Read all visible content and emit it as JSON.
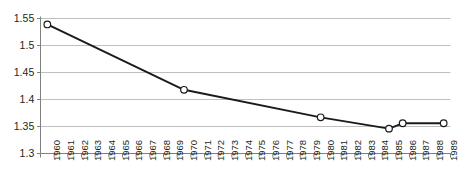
{
  "chart_data": {
    "type": "line",
    "title": "",
    "subtitle": "",
    "xlabel": "",
    "ylabel": "",
    "categories": [
      "1960",
      "1961",
      "1962",
      "1963",
      "1964",
      "1965",
      "1966",
      "1967",
      "1968",
      "1969",
      "1970",
      "1971",
      "1972",
      "1973",
      "1974",
      "1975",
      "1976",
      "1977",
      "1978",
      "1979",
      "1980",
      "1981",
      "1982",
      "1983",
      "1984",
      "1985",
      "1986",
      "1987",
      "1988",
      "1989"
    ],
    "series": [
      {
        "name": "",
        "points": [
          {
            "x": "1960",
            "y": 1.539
          },
          {
            "x": "1970",
            "y": 1.418
          },
          {
            "x": "1980",
            "y": 1.367
          },
          {
            "x": "1985",
            "y": 1.346
          },
          {
            "x": "1986",
            "y": 1.356
          },
          {
            "x": "1989",
            "y": 1.356
          }
        ]
      }
    ],
    "ylim": [
      1.3,
      1.55
    ],
    "yticks": [
      1.3,
      1.35,
      1.4,
      1.45,
      1.5,
      1.55
    ],
    "ytick_labels": [
      "1.3",
      "1.35",
      "1.4",
      "1.45",
      "1.5",
      "1.55"
    ],
    "grid": "horizontal",
    "legend": "none",
    "line_color": "#1a1a1a",
    "marker_fill": "#ffffff",
    "marker_edge": "#1a1a1a",
    "gridline_color": "#bfbfbf",
    "axis_color": "#808080",
    "text_color": "#231f20"
  }
}
